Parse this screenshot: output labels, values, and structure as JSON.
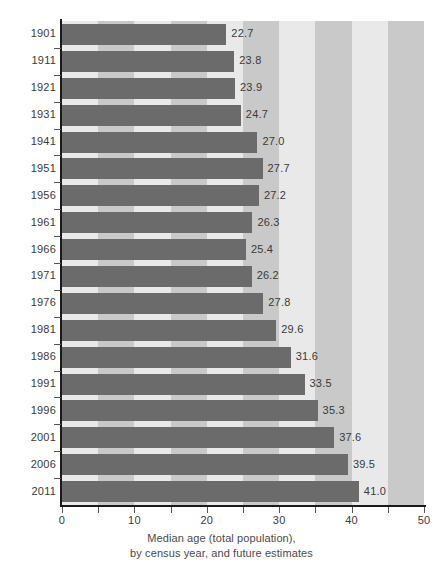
{
  "chart_data": {
    "type": "bar",
    "orientation": "horizontal",
    "title": "",
    "subtitle": "",
    "xlabel": "Median age (total population), by census year, and future estimates",
    "ylabel": "",
    "xlim": [
      0,
      50
    ],
    "xticks": [
      0,
      10,
      20,
      30,
      40,
      50
    ],
    "xtick_labels": [
      "0",
      "10",
      "20",
      "30",
      "40",
      "50"
    ],
    "minor_xticks": [
      5,
      15,
      25,
      35,
      45
    ],
    "grid": false,
    "background_bands": true,
    "band_width": 5,
    "legend": null,
    "categories": [
      "1901",
      "1911",
      "1921",
      "1931",
      "1941",
      "1951",
      "1956",
      "1961",
      "1966",
      "1971",
      "1976",
      "1981",
      "1986",
      "1991",
      "1996",
      "2001",
      "2006",
      "2011"
    ],
    "values": [
      22.7,
      23.8,
      23.9,
      24.7,
      27.0,
      27.7,
      27.2,
      26.3,
      25.4,
      26.2,
      27.8,
      29.6,
      31.6,
      33.5,
      35.3,
      37.6,
      39.5,
      41.0
    ],
    "value_labels": [
      "22.7",
      "23.8",
      "23.9",
      "24.7",
      "27.0",
      "27.7",
      "27.2",
      "26.3",
      "25.4",
      "26.2",
      "27.8",
      "29.6",
      "31.6",
      "33.5",
      "35.3",
      "37.6",
      "39.5",
      "41.0"
    ],
    "series": [
      {
        "name": "Median age",
        "values": [
          22.7,
          23.8,
          23.9,
          24.7,
          27.0,
          27.7,
          27.2,
          26.3,
          25.4,
          26.2,
          27.8,
          29.6,
          31.6,
          33.5,
          35.3,
          37.6,
          39.5,
          41.0
        ]
      }
    ]
  },
  "caption": {
    "line1": "Median age (total population),",
    "line2": "by census year, and future estimates"
  },
  "colors": {
    "bar": "#6b6b6b",
    "band_light": "#e9e9e9",
    "band_dark": "#c9c9c9",
    "axis": "#1a1a1a",
    "text": "#3a3a3a",
    "background": "#ffffff"
  }
}
